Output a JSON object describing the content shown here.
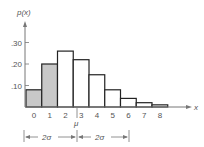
{
  "chart_data": {
    "type": "bar",
    "title": "",
    "xlabel": "x",
    "ylabel": "p(x)",
    "categories": [
      "0",
      "1",
      "2",
      "3",
      "4",
      "5",
      "6",
      "7",
      "8"
    ],
    "values": [
      0.08,
      0.2,
      0.26,
      0.22,
      0.15,
      0.08,
      0.04,
      0.02,
      0.01
    ],
    "shaded_categories": [
      "0",
      "1"
    ],
    "yticks": [
      ".10",
      ".20",
      ".30"
    ],
    "ylim": [
      0,
      0.35
    ],
    "grid": false,
    "annotations": {
      "mean_label": "μ",
      "left_interval": "2σ",
      "right_interval": "2σ"
    }
  },
  "colors": {
    "shaded": "#c8c8c8",
    "outline": "#222222",
    "axis": "#777777",
    "text": "#555555"
  }
}
